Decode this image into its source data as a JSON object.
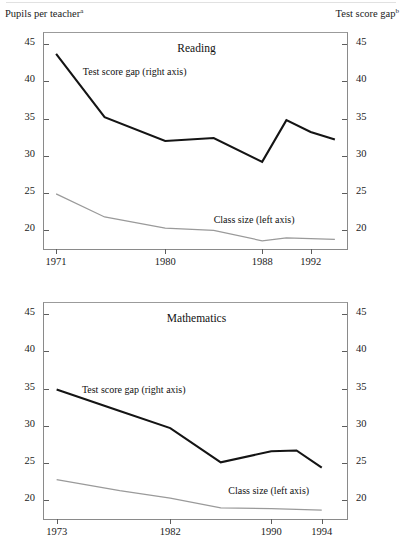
{
  "axis_captions": {
    "left": "Pupils per teacher",
    "left_note": "a",
    "right": "Test score gap",
    "right_note": "b"
  },
  "colors": {
    "gap_line": "#141414",
    "class_line": "#9a9a9a",
    "frame": "#8a8a8a",
    "text": "#1b1b1b"
  },
  "chart_data": [
    {
      "type": "line",
      "title": "Reading",
      "xlabel": "",
      "ylabel": "Pupils per teacher",
      "y2label": "Test score gap",
      "ylim": [
        17.5,
        46.5
      ],
      "y2lim": [
        17.5,
        46.5
      ],
      "yticks": [
        45,
        40,
        35,
        30,
        25,
        20
      ],
      "y2ticks": [
        45,
        40,
        35,
        30,
        25,
        20
      ],
      "xlim": [
        1970,
        1995
      ],
      "xticks": [
        1971,
        1980,
        1988,
        1992
      ],
      "xticklabels": [
        "1971",
        "1980",
        "1988",
        "1992"
      ],
      "grid": false,
      "legend": "inline-annotations",
      "series": [
        {
          "name": "Test score gap (right axis)",
          "axis": "right",
          "color": "#141414",
          "x": [
            1971,
            1975,
            1980,
            1984,
            1988,
            1990,
            1992,
            1994
          ],
          "values": [
            43.7,
            35.2,
            32.0,
            32.4,
            29.2,
            34.8,
            33.2,
            32.2
          ]
        },
        {
          "name": "Class size (left axis)",
          "axis": "left",
          "color": "#9a9a9a",
          "x": [
            1971,
            1975,
            1980,
            1984,
            1988,
            1990,
            1992,
            1994
          ],
          "values": [
            24.9,
            21.8,
            20.3,
            20.0,
            18.6,
            19.0,
            18.9,
            18.8
          ]
        }
      ],
      "annotations": [
        {
          "text": "Test score gap (right axis)",
          "x": 1973.2,
          "y": 41.2
        },
        {
          "text": "Class size (left axis)",
          "x": 1984.0,
          "y": 21.4
        }
      ]
    },
    {
      "type": "line",
      "title": "Mathematics",
      "xlabel": "",
      "ylabel": "Pupils per teacher",
      "y2label": "Test score gap",
      "ylim": [
        17.5,
        46.5
      ],
      "y2lim": [
        17.5,
        46.5
      ],
      "yticks": [
        45,
        40,
        35,
        30,
        25,
        20
      ],
      "y2ticks": [
        45,
        40,
        35,
        30,
        25,
        20
      ],
      "xlim": [
        1972,
        1996
      ],
      "xticks": [
        1973,
        1982,
        1990,
        1994
      ],
      "xticklabels": [
        "1973",
        "1982",
        "1990",
        "1994"
      ],
      "grid": false,
      "legend": "inline-annotations",
      "series": [
        {
          "name": "Test score gap (right axis)",
          "axis": "right",
          "color": "#141414",
          "x": [
            1973,
            1978,
            1982,
            1986,
            1990,
            1992,
            1994
          ],
          "values": [
            34.9,
            32.0,
            29.7,
            25.1,
            26.6,
            26.7,
            24.4
          ]
        },
        {
          "name": "Class size (left axis)",
          "axis": "left",
          "color": "#9a9a9a",
          "x": [
            1973,
            1978,
            1982,
            1986,
            1990,
            1992,
            1994
          ],
          "values": [
            22.8,
            21.3,
            20.3,
            19.0,
            18.9,
            18.8,
            18.7
          ]
        }
      ],
      "annotations": [
        {
          "text": "Test score gap (right axis)",
          "x": 1975.0,
          "y": 34.8
        },
        {
          "text": "Class size (left axis)",
          "x": 1986.6,
          "y": 21.2
        }
      ]
    }
  ]
}
